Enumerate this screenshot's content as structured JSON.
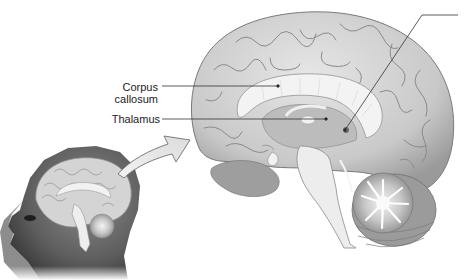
{
  "figure": {
    "type": "anatomical-illustration",
    "palette": {
      "background": "#ffffff",
      "cortex": "#cfcfcf",
      "cortex_shadow": "#8a8a8a",
      "white_matter": "#efefef",
      "deep_structures": "#a9a9a9",
      "cerebellum": "#bdbdbd",
      "skin": "#6b6b6b",
      "skin_dark": "#3a3a3a",
      "leader_line": "#333333",
      "text": "#222222"
    }
  },
  "labels": [
    {
      "id": "corpus-callosum",
      "lines": [
        "Corpus",
        "callosum"
      ]
    },
    {
      "id": "thalamus",
      "lines": [
        "Thalamus"
      ]
    }
  ],
  "unlabeled_leader": {
    "note": "Leader line at top right with no visible label text"
  },
  "inset": {
    "description": "Head profile facing left with brain shown in section"
  }
}
